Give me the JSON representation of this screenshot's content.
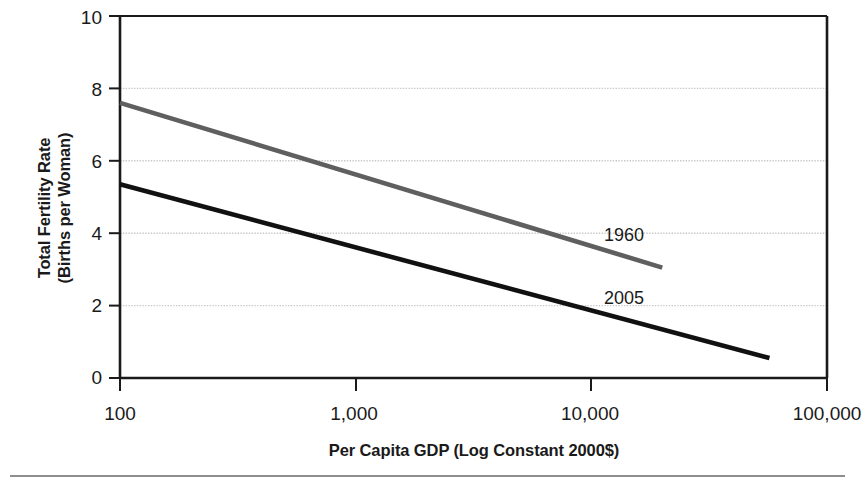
{
  "chart_data": {
    "type": "line",
    "title": "",
    "xlabel": "Per Capita GDP (Log Constant 2000$)",
    "ylabel": "Total Fertility Rate (Births per Woman)",
    "ylabel_line1": "Total Fertility Rate",
    "ylabel_line2": "(Births per Woman)",
    "xscale": "log",
    "xlim": [
      100,
      100000
    ],
    "ylim": [
      0,
      10
    ],
    "grid": "horizontal-dotted",
    "legend": "inline-annotations",
    "xticks": [
      100,
      1000,
      10000,
      100000
    ],
    "xticklabels": [
      "100",
      "1,000",
      "10,000",
      "100,000"
    ],
    "yticks": [
      0,
      2,
      4,
      6,
      8,
      10
    ],
    "yticklabels": [
      "0",
      "2",
      "4",
      "6",
      "8",
      "10"
    ],
    "series": [
      {
        "name": "1960",
        "color": "#5f5f5f",
        "x": [
          100,
          20000
        ],
        "y": [
          7.6,
          3.05
        ],
        "annotation": "1960",
        "annotation_x": 21000,
        "annotation_y": 4.2
      },
      {
        "name": "2005",
        "color": "#111111",
        "x": [
          100,
          57000
        ],
        "y": [
          5.35,
          0.55
        ],
        "annotation": "2005",
        "annotation_x": 21000,
        "annotation_y": 2.45
      }
    ]
  },
  "axes": {
    "y_title_line1": "Total Fertility Rate",
    "y_title_line2": "(Births per Woman)",
    "x_title": "Per Capita GDP (Log Constant 2000$)",
    "y_labels": [
      "10",
      "8",
      "6",
      "4",
      "2",
      "0"
    ],
    "x_labels": [
      "100",
      "1,000",
      "10,000",
      "100,000"
    ]
  },
  "annotations": {
    "series_1960": "1960",
    "series_2005": "2005"
  },
  "colors": {
    "line_1960": "#5f5f5f",
    "line_2005": "#111111",
    "grid": "#c8c8c8",
    "axis": "#1a1a1a",
    "rule": "#8e8e8e",
    "background": "#ffffff"
  }
}
